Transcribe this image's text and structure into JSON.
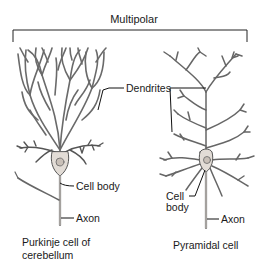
{
  "title": "Multipolar",
  "labels": {
    "dendrites": "Dendrites",
    "purkinje_cell_body": "Cell body",
    "purkinje_axon": "Axon",
    "pyramidal_cell_body_line1": "Cell",
    "pyramidal_cell_body_line2": "body",
    "pyramidal_axon": "Axon"
  },
  "captions": {
    "purkinje_line1": "Purkinje cell of",
    "purkinje_line2": "cerebellum",
    "pyramidal": "Pyramidal cell"
  },
  "colors": {
    "neuron_fill": "#e2dcd6",
    "neuron_stroke": "#555555",
    "leader_line": "#111111"
  }
}
